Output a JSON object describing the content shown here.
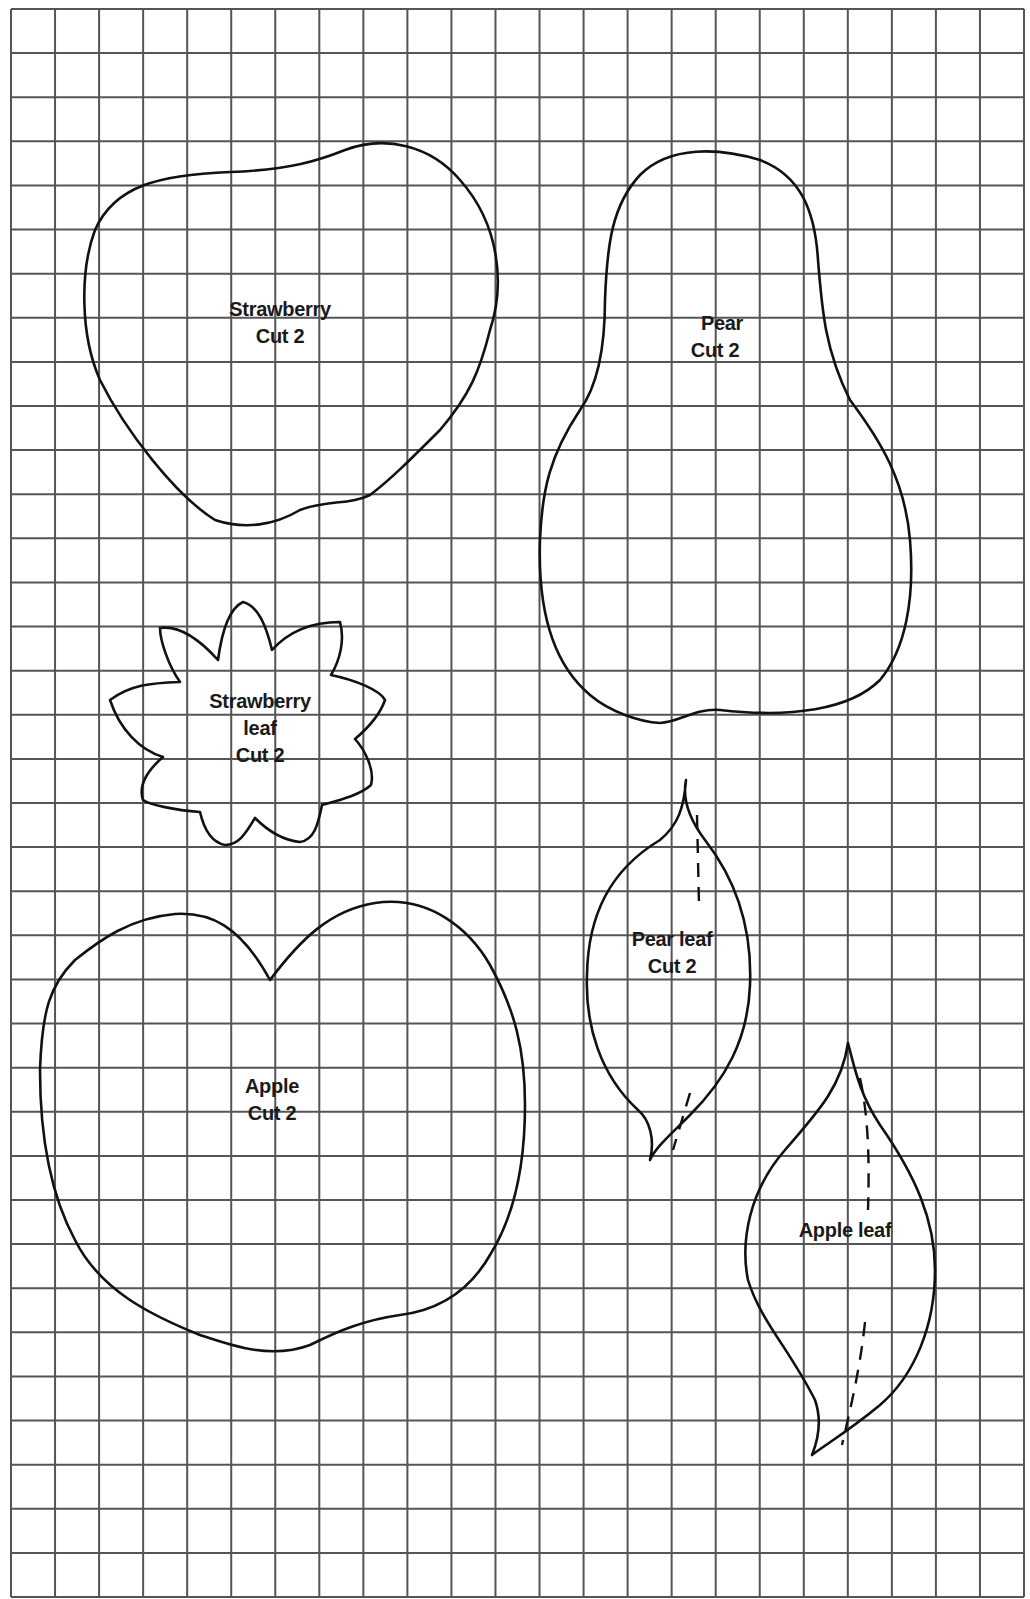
{
  "grid": {
    "columns": 23,
    "rows": 36,
    "x0": 11,
    "y0": 9,
    "x1": 1024,
    "y1": 1597,
    "line_color": "#555555"
  },
  "pieces": [
    {
      "id": "strawberry",
      "name": "Strawberry",
      "instruction": "Cut 2"
    },
    {
      "id": "pear",
      "name": "Pear",
      "instruction": "Cut 2"
    },
    {
      "id": "strawberry-leaf",
      "name": "Strawberry",
      "name2": "leaf",
      "instruction": "Cut 2"
    },
    {
      "id": "pear-leaf",
      "name": "Pear leaf",
      "instruction": "Cut 2"
    },
    {
      "id": "apple",
      "name": "Apple",
      "instruction": "Cut 2"
    },
    {
      "id": "apple-leaf",
      "name": "Apple leaf"
    }
  ]
}
